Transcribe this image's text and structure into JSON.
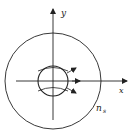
{
  "diagram": {
    "axes": {
      "x_label": "x",
      "y_label": "y"
    },
    "outer_region_label": "n",
    "outer_region_subscript": "s",
    "colors": {
      "stroke": "#222222",
      "background": "#ffffff"
    }
  }
}
